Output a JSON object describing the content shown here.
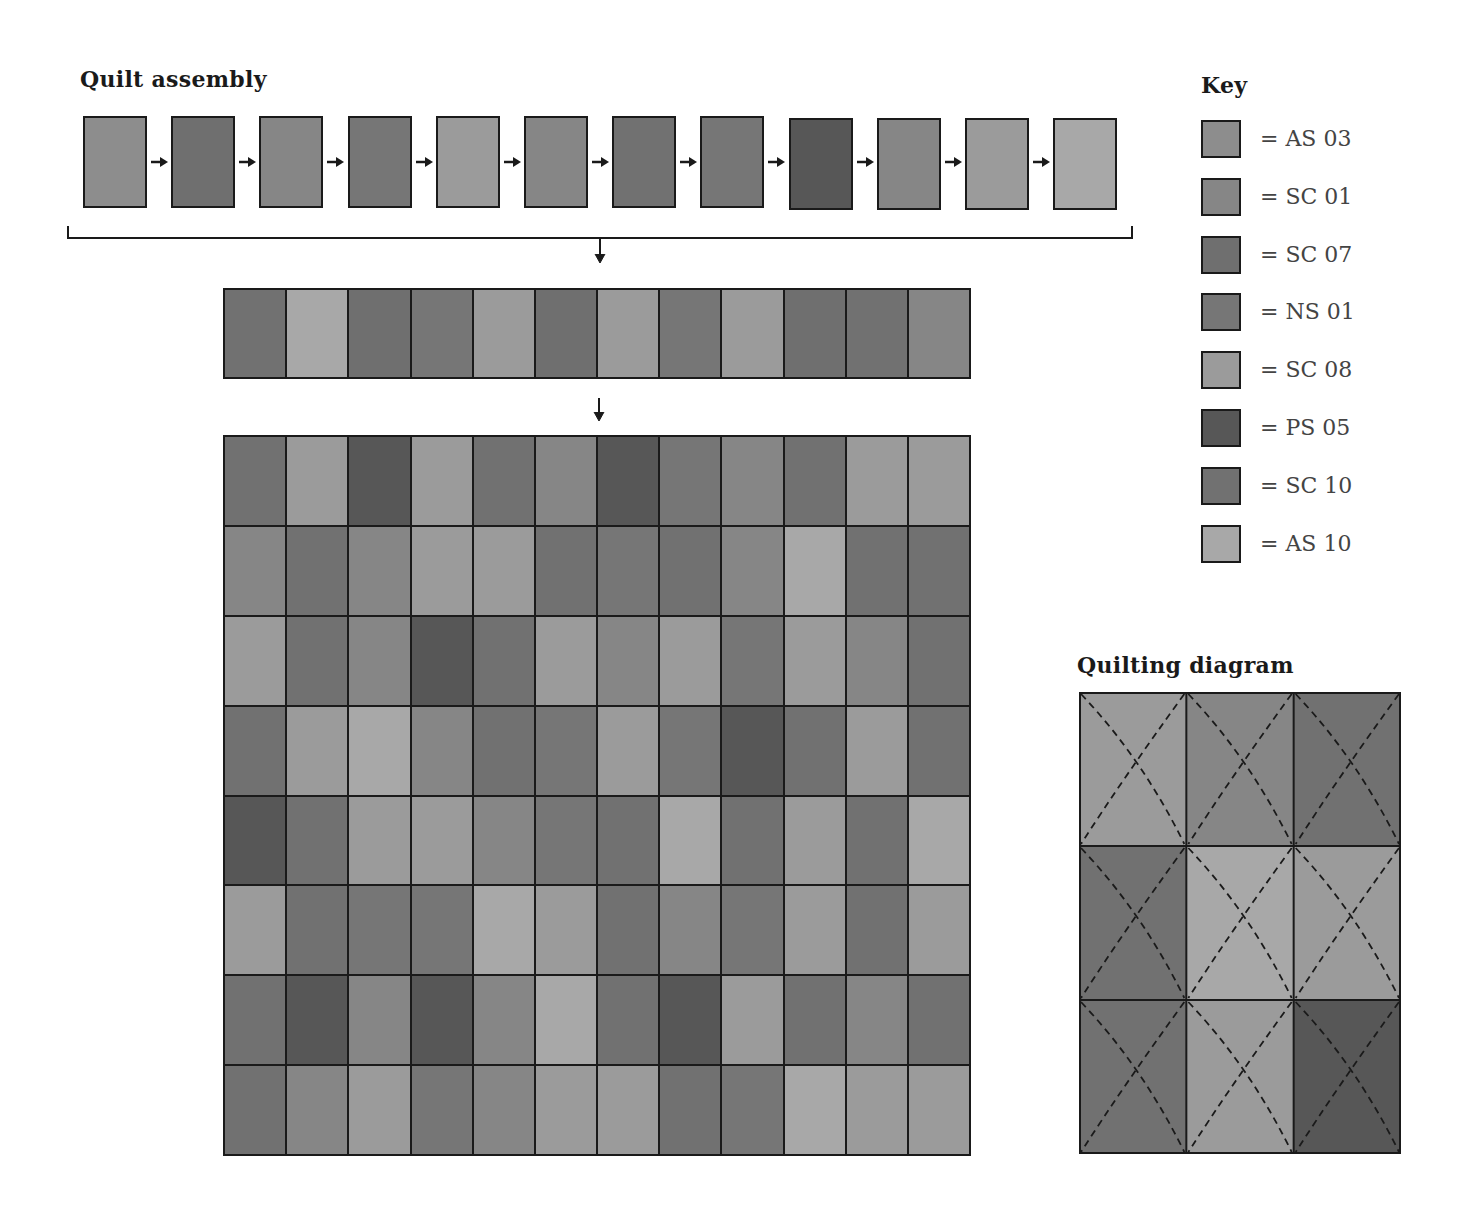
{
  "titles": {
    "assembly": "Quilt assembly",
    "key": "Key",
    "quilting": "Quilting diagram"
  },
  "colors": {
    "AS03": "#8d8d8d",
    "SC01": "#868686",
    "SC07": "#6f6f6f",
    "NS01": "#767676",
    "SC08": "#9b9b9b",
    "PS05": "#575757",
    "SC10": "#717171",
    "AS10": "#a8a8a8"
  },
  "key": [
    {
      "code": "AS03",
      "label": "= AS 03"
    },
    {
      "code": "SC01",
      "label": "= SC 01"
    },
    {
      "code": "SC07",
      "label": "= SC 07"
    },
    {
      "code": "NS01",
      "label": "= NS 01"
    },
    {
      "code": "SC08",
      "label": "= SC 08"
    },
    {
      "code": "PS05",
      "label": "= PS 05"
    },
    {
      "code": "SC10",
      "label": "= SC 10"
    },
    {
      "code": "AS10",
      "label": "= AS 10"
    }
  ],
  "assembly_blocks": [
    "AS03",
    "SC07",
    "SC01",
    "NS01",
    "SC08",
    "SC01",
    "SC10",
    "NS01",
    "PS05",
    "SC01",
    "SC08",
    "AS10"
  ],
  "joined_row": [
    "SC10",
    "AS10",
    "SC07",
    "NS01",
    "SC08",
    "SC07",
    "SC08",
    "NS01",
    "SC08",
    "SC07",
    "SC10",
    "SC01"
  ],
  "quilt_grid": [
    [
      "SC10",
      "SC08",
      "PS05",
      "SC08",
      "SC10",
      "SC01",
      "PS05",
      "NS01",
      "SC01",
      "SC10",
      "SC08",
      "SC08"
    ],
    [
      "SC01",
      "SC10",
      "SC01",
      "SC08",
      "SC08",
      "SC10",
      "NS01",
      "SC10",
      "SC01",
      "AS10",
      "SC10",
      "SC10"
    ],
    [
      "SC08",
      "SC10",
      "SC01",
      "PS05",
      "SC10",
      "SC08",
      "SC01",
      "SC08",
      "NS01",
      "SC08",
      "SC01",
      "SC10"
    ],
    [
      "SC10",
      "SC08",
      "AS10",
      "SC01",
      "SC10",
      "NS01",
      "SC08",
      "NS01",
      "PS05",
      "SC10",
      "SC08",
      "SC10"
    ],
    [
      "PS05",
      "SC10",
      "SC08",
      "SC08",
      "SC01",
      "NS01",
      "SC10",
      "AS10",
      "SC10",
      "SC08",
      "SC10",
      "AS10"
    ],
    [
      "SC08",
      "SC10",
      "NS01",
      "NS01",
      "AS10",
      "SC08",
      "SC10",
      "SC01",
      "NS01",
      "SC08",
      "SC10",
      "SC08"
    ],
    [
      "SC10",
      "PS05",
      "SC01",
      "PS05",
      "SC01",
      "AS10",
      "SC10",
      "PS05",
      "SC08",
      "SC10",
      "SC01",
      "SC10"
    ],
    [
      "SC10",
      "SC01",
      "SC08",
      "NS01",
      "SC01",
      "SC08",
      "SC08",
      "SC10",
      "NS01",
      "AS10",
      "SC08",
      "SC08"
    ]
  ],
  "quilting_grid": [
    [
      "SC08",
      "SC01",
      "SC10"
    ],
    [
      "SC10",
      "AS10",
      "SC08"
    ],
    [
      "SC10",
      "SC08",
      "PS05"
    ]
  ]
}
